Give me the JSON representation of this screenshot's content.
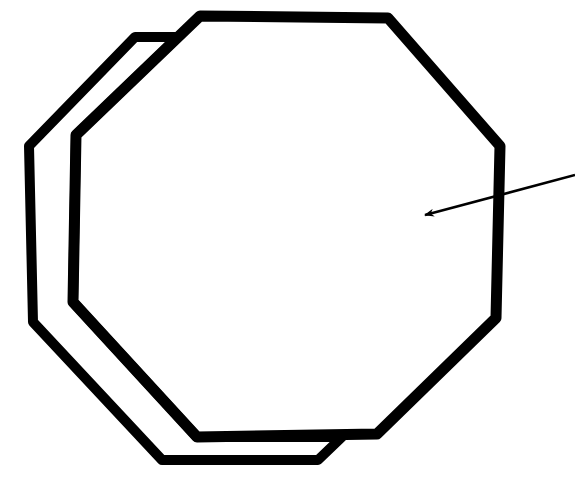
{
  "diagram": {
    "type": "line-drawing",
    "background": "#ffffff",
    "stroke_color": "#000000",
    "shapes": [
      {
        "name": "back-octagon",
        "points": "135,37 178,37 76,135 73,302 197,437 342,437 318,460 162,460 33,322 29,146"
      },
      {
        "name": "front-octagon",
        "points": "200,16 388,18 500,146 496,318 377,434 197,437 73,302 76,135"
      }
    ],
    "arrow": {
      "x1": 575,
      "y1": 175,
      "x2": 425,
      "y2": 215
    }
  }
}
